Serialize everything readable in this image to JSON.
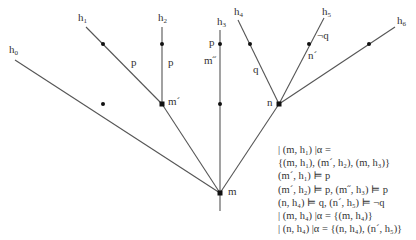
{
  "diagram": {
    "type": "branching-time tree",
    "colors": {
      "line": "#555555",
      "dot": "#111111",
      "text": "#333333"
    },
    "nodes": {
      "m": {
        "label": "m",
        "x": 220,
        "y": 193
      },
      "m_prime": {
        "label": "m´",
        "x": 162,
        "y": 104
      },
      "n": {
        "label": "n",
        "x": 279,
        "y": 104
      },
      "trunk_bottom": {
        "x": 220,
        "y": 211
      }
    },
    "histories": [
      {
        "label": "h",
        "sub": "0",
        "end": [
          15,
          60
        ],
        "from": "m",
        "dots": [
          [
            103,
            104
          ]
        ]
      },
      {
        "label": "h",
        "sub": "1",
        "end": [
          86,
          27
        ],
        "from": "m_prime",
        "dots": [
          [
            103,
            44
          ]
        ]
      },
      {
        "label": "h",
        "sub": "2",
        "end": [
          162,
          27
        ],
        "from": "m_prime",
        "dots": [
          [
            162,
            44
          ]
        ]
      },
      {
        "label": "h",
        "sub": "3",
        "end": [
          220,
          30
        ],
        "from": "m",
        "dots": [
          [
            220,
            44
          ],
          [
            220,
            104
          ]
        ]
      },
      {
        "label": "h",
        "sub": "4",
        "end": [
          238,
          20
        ],
        "from": "n",
        "dots": [
          [
            250,
            44
          ]
        ]
      },
      {
        "label": "h",
        "sub": "5",
        "end": [
          324,
          18
        ],
        "from": "n",
        "dots": [
          [
            309,
            44
          ]
        ]
      },
      {
        "label": "h",
        "sub": "6",
        "end": [
          395,
          27
        ],
        "from": "n",
        "dots": [
          [
            369,
            44
          ]
        ]
      }
    ],
    "edge_labels": {
      "h1_p": "p",
      "h2_p": "p",
      "h3_p": "p",
      "h3_m_double_prime": "m˝",
      "h4_q": "q",
      "h5_not_q": "¬q",
      "h5_n_prime": "n´"
    },
    "node_labels": {
      "m": "m",
      "m_prime": "m´",
      "n": "n"
    },
    "formulas": [
      "| (m, h₁) |α =",
      "{(m, h₁), (m´, h₂), (m, h₃)}",
      "(m´, h₁) ⊨ p",
      "(m´, h₂) ⊨ p, (m˝, h₃) ⊨ p",
      "(n, h₄) ⊨ q, (n´, h₅) ⊨ ¬q",
      "| (m, h₄) |α = {(m, h₄)}",
      "| (n, h₄) |α = {(n, h₄), (n´, h₅)}"
    ]
  }
}
